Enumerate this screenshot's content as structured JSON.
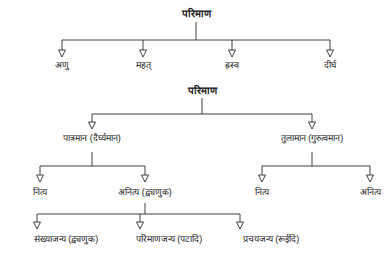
{
  "diagram": {
    "title": "परिमाण",
    "type": "tree-diagram",
    "language": "Devanagari",
    "colors": {
      "background": "#ffffff",
      "text": "#202020",
      "line": "#2b2b2b"
    },
    "tree_a": {
      "root": "परिमाण",
      "children": [
        {
          "label": "अणु"
        },
        {
          "label": "महत्"
        },
        {
          "label": "ह्रस्व"
        },
        {
          "label": "दीर्घ"
        }
      ]
    },
    "tree_b": {
      "root": "परिमाण",
      "children": [
        {
          "label": "पात्रमान (दैर्घ्यमान)",
          "children": [
            {
              "label": "नित्य"
            },
            {
              "label": "अनित्य (द्व्यणुक)",
              "children": [
                {
                  "label": "संख्याजन्य (द्व्यणुक)"
                },
                {
                  "label": "परिमाणजन्य (पटादि)"
                },
                {
                  "label": "प्रचयजन्य (रूईदि)"
                }
              ]
            }
          ]
        },
        {
          "label": "तुलामान (गुरुत्वमान)",
          "children": [
            {
              "label": "नित्य"
            },
            {
              "label": "अनित्य"
            }
          ]
        }
      ]
    }
  }
}
